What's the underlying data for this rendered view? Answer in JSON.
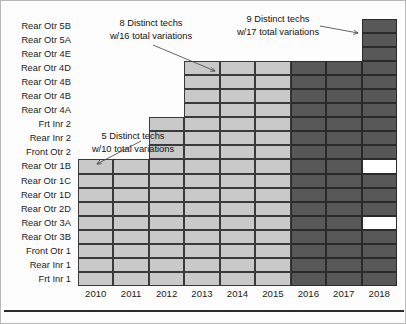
{
  "chart_data": {
    "type": "heatmap",
    "title": "",
    "xlabel": "",
    "ylabel": "",
    "grid": true,
    "legend_position": "none",
    "categories": [
      "2010",
      "2011",
      "2012",
      "2013",
      "2014",
      "2015",
      "2016",
      "2017",
      "2018"
    ],
    "rows": [
      "Rear Otr 5B",
      "Rear Otr 5A",
      "Rear Otr 4E",
      "Rear Otr 4D",
      "Rear Otr 4B",
      "Rear Otr 4B",
      "Rear Otr 4A",
      "Frt Inr 2",
      "Rear Inr 2",
      "Front Otr 2",
      "Rear Otr 1B",
      "Rear Otr 1C",
      "Rear Otr 1D",
      "Rear Otr 2D",
      "Rear Otr 3A",
      "Rear Otr 3B",
      "Front Otr 1",
      "Rear Inr 1",
      "Frt Inr 1"
    ],
    "states": {
      "empty": "empty",
      "light": "light",
      "dark": "dark",
      "white": "white"
    },
    "colors": {
      "light": "#c9c9c9",
      "dark": "#585858",
      "white": "#ffffff",
      "gridline": "#2a2a2a",
      "text": "#1b1b1b"
    },
    "matrix": [
      [
        "empty",
        "empty",
        "empty",
        "empty",
        "empty",
        "empty",
        "empty",
        "empty",
        "dark"
      ],
      [
        "empty",
        "empty",
        "empty",
        "empty",
        "empty",
        "empty",
        "empty",
        "empty",
        "dark"
      ],
      [
        "empty",
        "empty",
        "empty",
        "empty",
        "empty",
        "empty",
        "empty",
        "empty",
        "dark"
      ],
      [
        "empty",
        "empty",
        "empty",
        "light",
        "light",
        "light",
        "dark",
        "dark",
        "dark"
      ],
      [
        "empty",
        "empty",
        "empty",
        "light",
        "light",
        "light",
        "dark",
        "dark",
        "dark"
      ],
      [
        "empty",
        "empty",
        "empty",
        "light",
        "light",
        "light",
        "dark",
        "dark",
        "dark"
      ],
      [
        "empty",
        "empty",
        "empty",
        "light",
        "light",
        "light",
        "dark",
        "dark",
        "dark"
      ],
      [
        "empty",
        "empty",
        "light",
        "light",
        "light",
        "light",
        "dark",
        "dark",
        "dark"
      ],
      [
        "empty",
        "empty",
        "light",
        "light",
        "light",
        "light",
        "dark",
        "dark",
        "dark"
      ],
      [
        "empty",
        "empty",
        "light",
        "light",
        "light",
        "light",
        "dark",
        "dark",
        "dark"
      ],
      [
        "light",
        "light",
        "light",
        "light",
        "light",
        "light",
        "dark",
        "dark",
        "white"
      ],
      [
        "light",
        "light",
        "light",
        "light",
        "light",
        "light",
        "dark",
        "dark",
        "dark"
      ],
      [
        "light",
        "light",
        "light",
        "light",
        "light",
        "light",
        "dark",
        "dark",
        "dark"
      ],
      [
        "light",
        "light",
        "light",
        "light",
        "light",
        "light",
        "dark",
        "dark",
        "dark"
      ],
      [
        "light",
        "light",
        "light",
        "light",
        "light",
        "light",
        "dark",
        "dark",
        "white"
      ],
      [
        "light",
        "light",
        "light",
        "light",
        "light",
        "light",
        "dark",
        "dark",
        "dark"
      ],
      [
        "light",
        "light",
        "light",
        "light",
        "light",
        "light",
        "dark",
        "dark",
        "dark"
      ],
      [
        "light",
        "light",
        "light",
        "light",
        "light",
        "light",
        "dark",
        "dark",
        "dark"
      ],
      [
        "light",
        "light",
        "light",
        "light",
        "light",
        "light",
        "dark",
        "dark",
        "dark"
      ]
    ],
    "annotations": [
      {
        "id": "anno1",
        "line1": "8 Distinct techs",
        "line2": "w/16 total variations",
        "distinct_techs": 8,
        "total_variations": 16
      },
      {
        "id": "anno2",
        "line1": "9 Distinct techs",
        "line2": "w/17 total variations",
        "distinct_techs": 9,
        "total_variations": 17
      },
      {
        "id": "anno3",
        "line1": "5 Distinct techs",
        "line2": "w/10 total variations",
        "distinct_techs": 5,
        "total_variations": 10
      }
    ]
  }
}
